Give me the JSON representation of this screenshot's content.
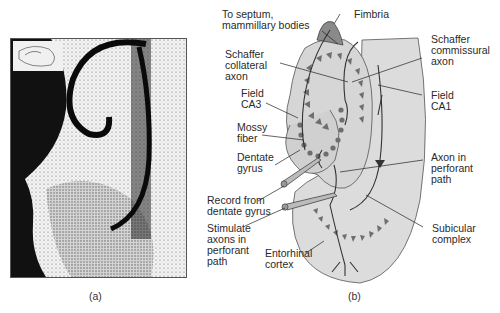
{
  "panel_a": {
    "caption": "(a)",
    "description": "Nissl-stained section of hippocampal formation with inset schematic"
  },
  "panel_b": {
    "caption": "(b)",
    "labels": {
      "septum": "To septum,\nmammillary bodies",
      "fimbria": "Fimbria",
      "schaffer_collateral": "Schaffer\ncollateral\naxon",
      "schaffer_commissural": "Schaffer\ncommissural\naxon",
      "field_ca3": "Field\nCA3",
      "field_ca1": "Field\nCA1",
      "mossy_fiber": "Mossy\nfiber",
      "dentate_gyrus": "Dentate\ngyrus",
      "axon_perforant": "Axon in\nperforant\npath",
      "record": "Record from\ndentate gyrus",
      "stimulate": "Stimulate\naxons in\nperforant\npath",
      "subicular": "Subicular\ncomplex",
      "entorhinal": "Entorhinal\ncortex"
    }
  },
  "colors": {
    "tissue": "#dcdcdc",
    "fimbria": "#8a8a8a",
    "cells": "#6e6e6e",
    "line": "#333333"
  }
}
